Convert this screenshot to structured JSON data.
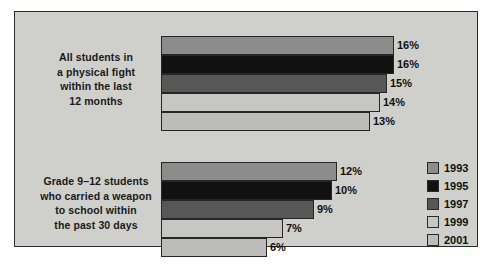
{
  "chart_data": {
    "type": "bar",
    "orientation": "horizontal",
    "title": "",
    "subtitle": "",
    "xlabel": "",
    "ylabel": "",
    "grid": false,
    "legend_position": "right",
    "xlim": [
      0,
      17
    ],
    "value_suffix": "%",
    "categories": [
      "All students in a physical fight within the last 12 months",
      "Grade 9–12 students who carried a weapon to school within the past 30 days"
    ],
    "series": [
      {
        "name": "1993",
        "color": "#8c8c8c",
        "values": [
          16,
          12
        ]
      },
      {
        "name": "1995",
        "color": "#111111",
        "values": [
          16,
          10
        ]
      },
      {
        "name": "1997",
        "color": "#575757",
        "values": [
          15,
          9
        ]
      },
      {
        "name": "1999",
        "color": "#c6c6c2",
        "values": [
          14,
          7
        ]
      },
      {
        "name": "2001",
        "color": "#bcbcb8",
        "values": [
          13,
          6
        ]
      }
    ]
  },
  "panel": {
    "background_color": "#cfcfcb",
    "border_color": "#2c2c2c"
  },
  "category_labels": [
    {
      "name": "all-students-fight",
      "lines": [
        "All students in",
        "a physical fight",
        "within the last",
        "12 months"
      ]
    },
    {
      "name": "weapon-at-school",
      "lines": [
        "Grade 9–12 students",
        "who carried a weapon",
        "to school within",
        "the past 30 days"
      ]
    }
  ],
  "groups": [
    {
      "name": "group-fight",
      "bars": [
        {
          "year": "1993",
          "value_label": "16%",
          "value": 16,
          "color": "#8c8c8c",
          "px": 233
        },
        {
          "year": "1995",
          "value_label": "16%",
          "value": 16,
          "color": "#111111",
          "px": 233
        },
        {
          "year": "1997",
          "value_label": "15%",
          "value": 15,
          "color": "#575757",
          "px": 226
        },
        {
          "year": "1999",
          "value_label": "14%",
          "value": 14,
          "color": "#c6c6c2",
          "px": 219
        },
        {
          "year": "2001",
          "value_label": "13%",
          "value": 13,
          "color": "#bcbcb8",
          "px": 209
        }
      ]
    },
    {
      "name": "group-weapon",
      "bars": [
        {
          "year": "1993",
          "value_label": "12%",
          "value": 12,
          "color": "#8c8c8c",
          "px": 176
        },
        {
          "year": "1995",
          "value_label": "10%",
          "value": 10,
          "color": "#111111",
          "px": 171
        },
        {
          "year": "1997",
          "value_label": "9%",
          "value": 9,
          "color": "#575757",
          "px": 153
        },
        {
          "year": "1999",
          "value_label": "7%",
          "value": 7,
          "color": "#c6c6c2",
          "px": 122
        },
        {
          "year": "2001",
          "value_label": "6%",
          "value": 6,
          "color": "#bcbcb8",
          "px": 106
        }
      ]
    }
  ],
  "legend": {
    "items": [
      {
        "label": "1993",
        "color": "#8c8c8c"
      },
      {
        "label": "1995",
        "color": "#111111"
      },
      {
        "label": "1997",
        "color": "#575757"
      },
      {
        "label": "1999",
        "color": "#c6c6c2"
      },
      {
        "label": "2001",
        "color": "#bcbcb8"
      }
    ]
  }
}
